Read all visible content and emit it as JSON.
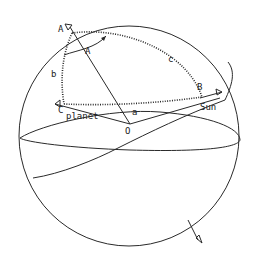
{
  "figure": {
    "type": "celestial-sphere-spherical-triangle",
    "labels": {
      "pole": "A",
      "angle_A": "A",
      "side_b": "b",
      "side_c": "c",
      "side_a": "a",
      "vertex_B": "B",
      "vertex_C": "C",
      "center": "O",
      "planet": "planet",
      "sun": "Sun"
    }
  },
  "colors": {
    "ink": "#2a2a2a",
    "background": "#ffffff"
  }
}
